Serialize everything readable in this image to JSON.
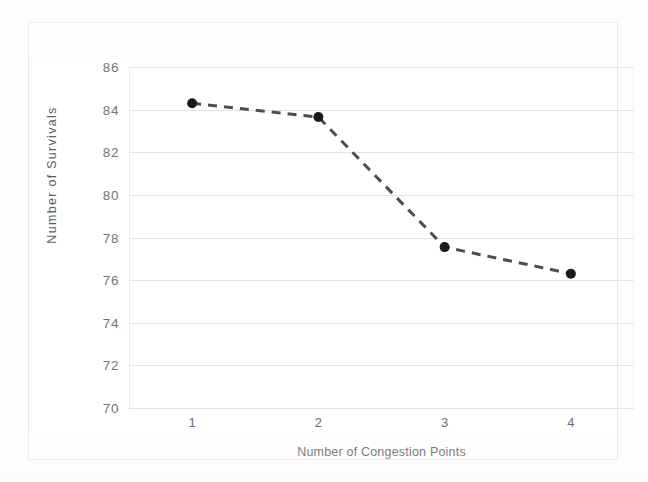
{
  "chart_data": {
    "type": "line",
    "title": "",
    "xlabel": "Number of Congestion Points",
    "ylabel": "Number of Survivals",
    "categories": [
      "1",
      "2",
      "3",
      "4"
    ],
    "x": [
      1,
      2,
      3,
      4
    ],
    "values": [
      84.3,
      83.65,
      77.55,
      76.3
    ],
    "series": [
      {
        "name": "Number of Survivals",
        "values": [
          84.3,
          83.65,
          77.55,
          76.3
        ]
      }
    ],
    "xlim": [
      0.5,
      4.5
    ],
    "ylim": [
      70,
      86
    ],
    "y_ticks": [
      "70",
      "72",
      "74",
      "76",
      "78",
      "80",
      "82",
      "84",
      "86"
    ],
    "y_tick_values": [
      70,
      72,
      74,
      76,
      78,
      80,
      82,
      84,
      86
    ],
    "x_ticks": [
      "1",
      "2",
      "3",
      "4"
    ],
    "grid": "horizontal",
    "legend": "none",
    "line_style": "dashed",
    "marker": "circle",
    "colors": {
      "line": "#4d4d4d",
      "marker": "#1a1a1a",
      "gridline": "#e4e4e4",
      "frame": "#e8e8e8",
      "tick_text": "#5f5f5f",
      "axis_title_text": "#4f4f4f",
      "background": "#ffffff"
    }
  },
  "axes": {
    "y_title": "Number of Survivals",
    "x_title": "Number of Congestion Points"
  }
}
